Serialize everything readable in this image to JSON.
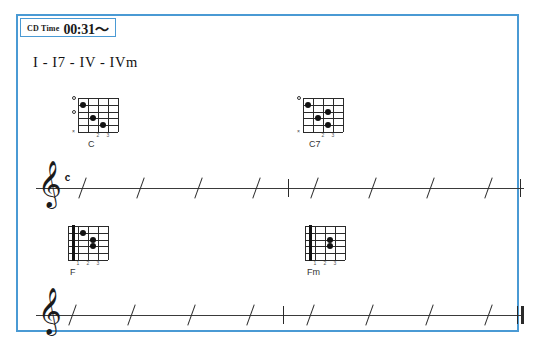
{
  "badge": {
    "label": "CD Time",
    "time": "00:31〜",
    "border_color": "#4a9ad4"
  },
  "frame": {
    "border_color": "#4a9ad4"
  },
  "lesson": {
    "progression_title": "I - I7 - IV - IVm"
  },
  "chords": [
    {
      "name": "C",
      "position": {
        "left": 60,
        "top": 82
      },
      "name_offset_left": 10,
      "barre": null,
      "markers": [
        {
          "type": "open",
          "string_index": 0
        },
        {
          "type": "open",
          "string_index": 2
        },
        {
          "type": "mute",
          "string_index": 5,
          "glyph": "×"
        }
      ],
      "fret_numbers": [
        {
          "fret": "2",
          "fret_index": 2
        },
        {
          "fret": "3",
          "fret_index": 3
        }
      ],
      "dots": [
        {
          "string_index": 1,
          "fret_index": 1
        },
        {
          "string_index": 3,
          "fret_index": 2
        },
        {
          "string_index": 4,
          "fret_index": 3
        }
      ]
    },
    {
      "name": "C7",
      "position": {
        "left": 285,
        "top": 82
      },
      "name_offset_left": 6,
      "barre": null,
      "markers": [
        {
          "type": "open",
          "string_index": 0
        },
        {
          "type": "mute",
          "string_index": 5,
          "glyph": "×"
        }
      ],
      "fret_numbers": [
        {
          "fret": "2",
          "fret_index": 2
        },
        {
          "fret": "3",
          "fret_index": 3
        }
      ],
      "dots": [
        {
          "string_index": 1,
          "fret_index": 1
        },
        {
          "string_index": 2,
          "fret_index": 3
        },
        {
          "string_index": 3,
          "fret_index": 2
        },
        {
          "string_index": 4,
          "fret_index": 3
        }
      ]
    },
    {
      "name": "F",
      "position": {
        "left": 50,
        "top": 210
      },
      "name_offset_left": 2,
      "barre": {
        "fret_index": 1
      },
      "markers": [],
      "fret_numbers": [
        {
          "fret": "1",
          "fret_index": 1
        },
        {
          "fret": "2",
          "fret_index": 2
        },
        {
          "fret": "3",
          "fret_index": 3
        }
      ],
      "dots": [
        {
          "string_index": 1,
          "fret_index": 2
        },
        {
          "string_index": 2,
          "fret_index": 3
        },
        {
          "string_index": 3,
          "fret_index": 3
        }
      ]
    },
    {
      "name": "Fm",
      "position": {
        "left": 287,
        "top": 210
      },
      "name_offset_left": 2,
      "barre": {
        "fret_index": 1
      },
      "markers": [],
      "fret_numbers": [
        {
          "fret": "1",
          "fret_index": 1
        },
        {
          "fret": "2",
          "fret_index": 2
        },
        {
          "fret": "3",
          "fret_index": 3
        }
      ],
      "dots": [
        {
          "string_index": 2,
          "fret_index": 3
        },
        {
          "string_index": 3,
          "fret_index": 3
        }
      ]
    }
  ],
  "staves": [
    {
      "id": "staff-upper",
      "position": {
        "left": 18,
        "top": 150
      },
      "width": 488,
      "clef": "𝄞",
      "clef_name": "treble-clef",
      "time_signature": "𝄴",
      "time_signature_name": "common-time",
      "slash_count": 8,
      "mid_barline": true,
      "end_barline": "single",
      "measures": 2,
      "beats_per_measure": 4
    },
    {
      "id": "staff-lower",
      "position": {
        "left": 18,
        "top": 277
      },
      "width": 488,
      "clef": "𝄞",
      "clef_name": "treble-clef",
      "time_signature": "",
      "time_signature_name": "none",
      "slash_count": 8,
      "mid_barline": true,
      "end_barline": "final",
      "measures": 2,
      "beats_per_measure": 4
    }
  ]
}
